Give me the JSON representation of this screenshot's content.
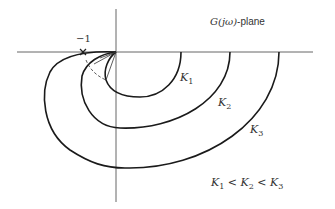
{
  "diagram": {
    "title": "G(jω)-plane",
    "plane_label": {
      "func": "G(jω)",
      "suffix": "-plane"
    },
    "critical_point_label": "−1",
    "curves": [
      {
        "name": "K1",
        "label_base": "K",
        "label_sub": "1",
        "real_axis_crossing_px": 181
      },
      {
        "name": "K2",
        "label_base": "K",
        "label_sub": "2",
        "real_axis_crossing_px": 230
      },
      {
        "name": "K3",
        "label_base": "K",
        "label_sub": "3",
        "real_axis_crossing_px": 279
      }
    ],
    "relation": {
      "parts": [
        "K",
        "1",
        " < ",
        "K",
        "2",
        " < ",
        "K",
        "3"
      ],
      "text": "K1 < K2 < K3"
    },
    "colors": {
      "curve": "#1a1a1a",
      "axis": "#555555",
      "text": "#333333"
    }
  }
}
